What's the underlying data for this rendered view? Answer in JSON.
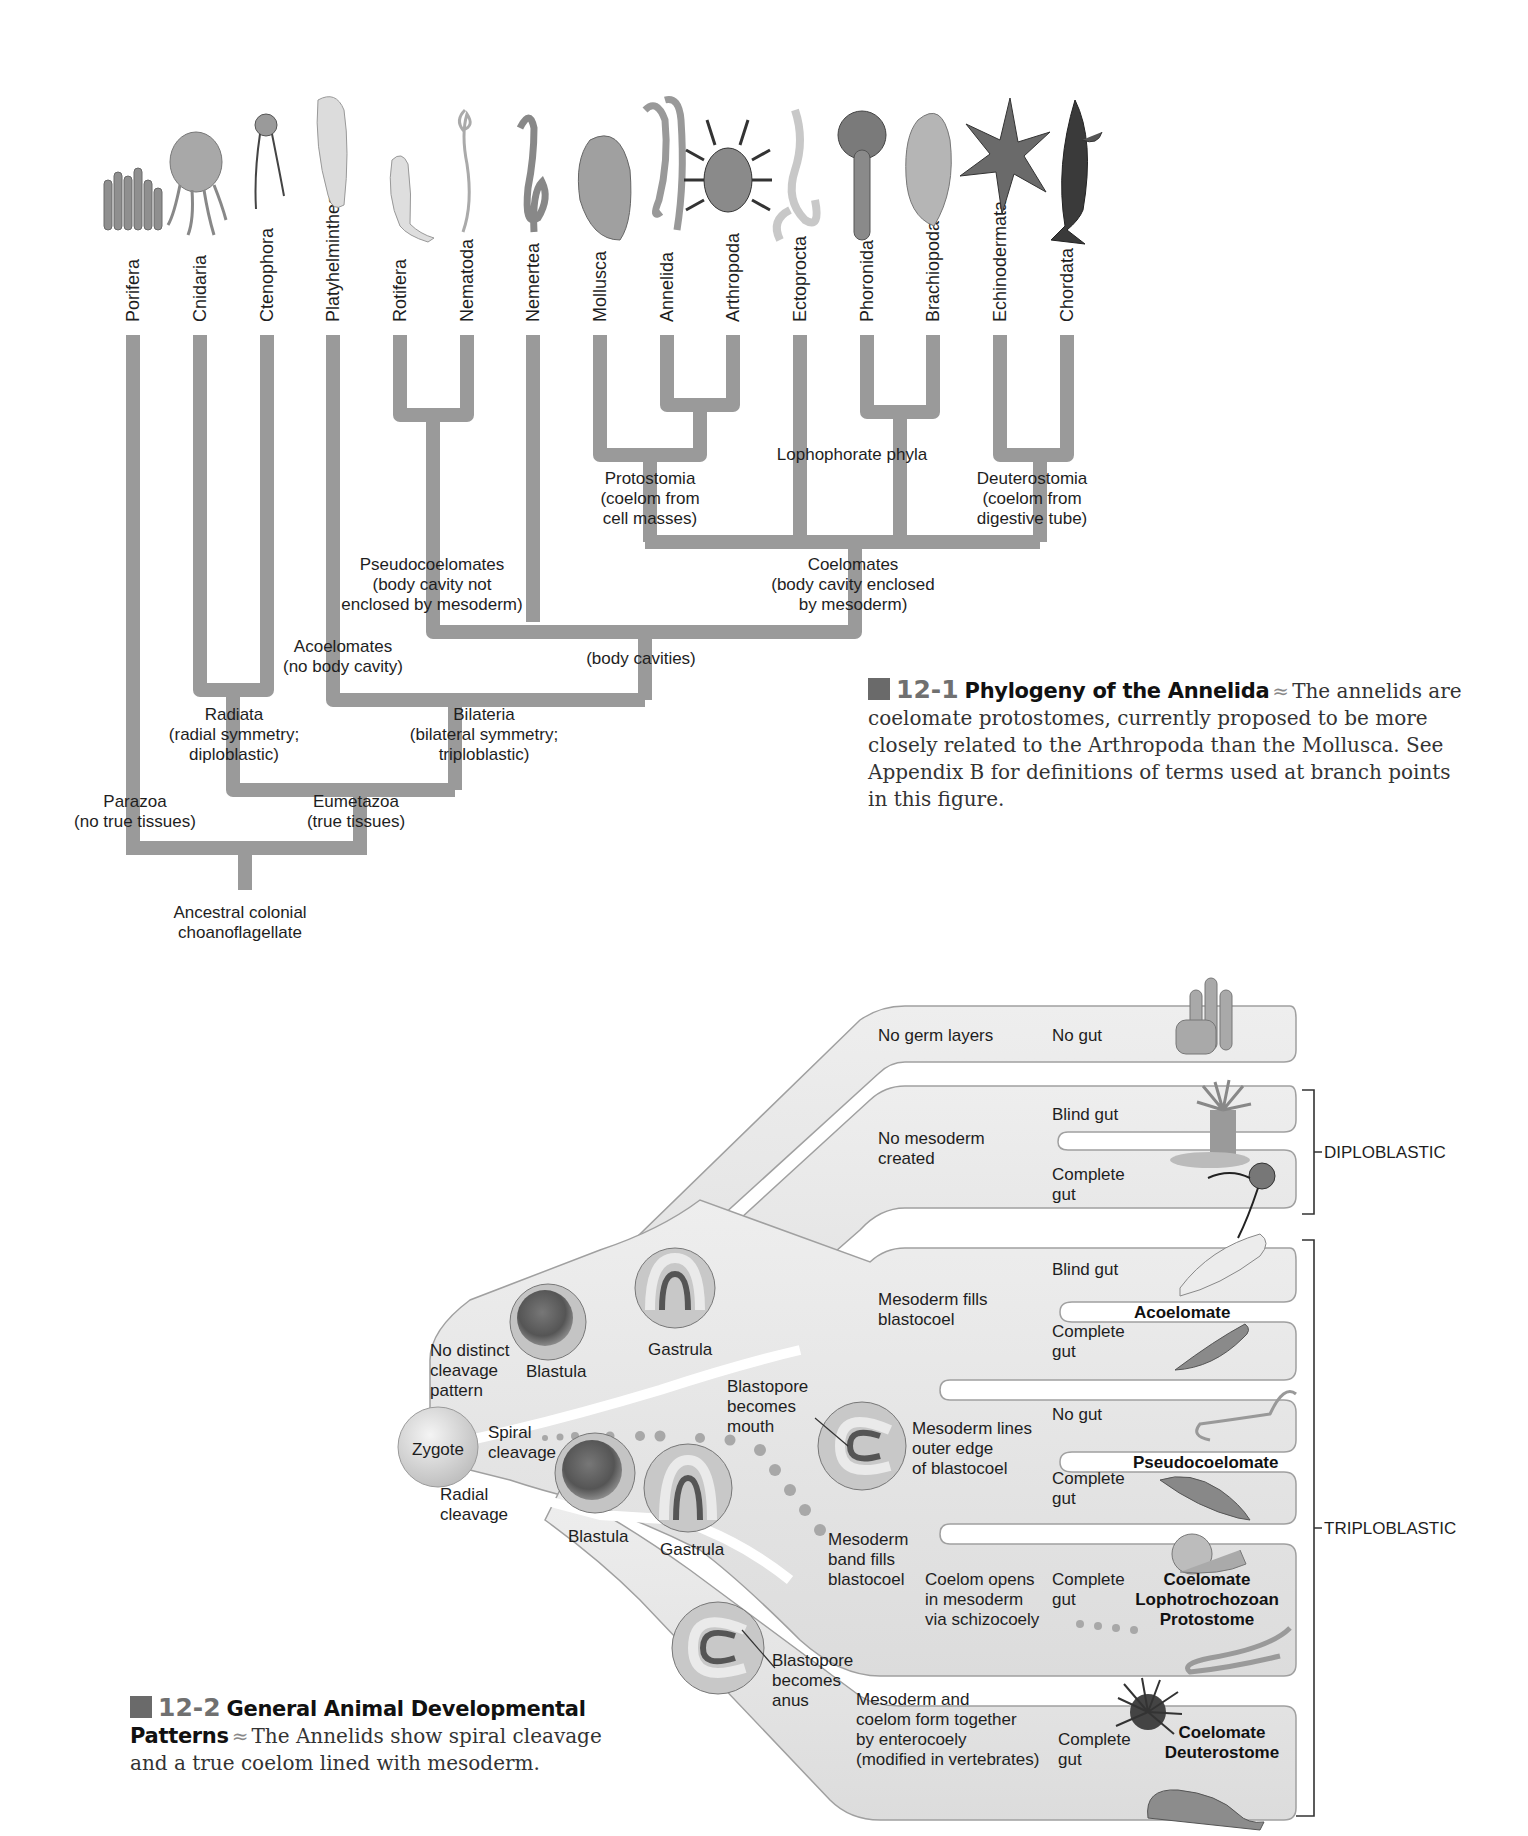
{
  "figure_12_1": {
    "phyla": [
      {
        "name": "Porifera",
        "animal": "sponge-icon"
      },
      {
        "name": "Cnidaria",
        "animal": "jellyfish-icon"
      },
      {
        "name": "Ctenophora",
        "animal": "comb-jelly-icon"
      },
      {
        "name": "Platyhelminthes",
        "animal": "flatworm-icon"
      },
      {
        "name": "Rotifera",
        "animal": "rotifer-icon"
      },
      {
        "name": "Nematoda",
        "animal": "roundworm-icon"
      },
      {
        "name": "Nemertea",
        "animal": "ribbon-worm-icon"
      },
      {
        "name": "Mollusca",
        "animal": "clam-icon"
      },
      {
        "name": "Annelida",
        "animal": "segmented-worm-icon"
      },
      {
        "name": "Arthropoda",
        "animal": "crab-icon"
      },
      {
        "name": "Ectoprocta",
        "animal": "bryozoan-icon"
      },
      {
        "name": "Phoronida",
        "animal": "phoronid-icon"
      },
      {
        "name": "Brachiopoda",
        "animal": "lamp-shell-icon"
      },
      {
        "name": "Echinodermata",
        "animal": "sea-star-icon"
      },
      {
        "name": "Chordata",
        "animal": "shark-icon"
      }
    ],
    "nodes": {
      "protostomia": [
        "Protostomia",
        "(coelom from",
        "cell masses)"
      ],
      "lophophorate": [
        "Lophophorate phyla"
      ],
      "deuterostomia": [
        "Deuterostomia",
        "(coelom from",
        "digestive tube)"
      ],
      "pseudocoelomates": [
        "Pseudocoelomates",
        "(body cavity not",
        "enclosed by mesoderm)"
      ],
      "coelomates": [
        "Coelomates",
        "(body cavity enclosed",
        "by mesoderm)"
      ],
      "body_cavities": [
        "(body cavities)"
      ],
      "acoelomates": [
        "Acoelomates",
        "(no body cavity)"
      ],
      "radiata": [
        "Radiata",
        "(radial symmetry;",
        "diploblastic)"
      ],
      "bilateria": [
        "Bilateria",
        "(bilateral symmetry;",
        "triploblastic)"
      ],
      "parazoa": [
        "Parazoa",
        "(no true tissues)"
      ],
      "eumetazoa": [
        "Eumetazoa",
        "(true tissues)"
      ],
      "ancestor": [
        "Ancestral colonial",
        "choanoflagellate"
      ]
    },
    "caption": {
      "number": "12-1",
      "title": "Phylogeny of the Annelida",
      "text": "The annelids are coelomate protostomes, currently proposed to be more closely related to the Arthropoda than the Mollusca. See Appendix B for definitions of terms used at branch points in this figure."
    }
  },
  "figure_12_2": {
    "zygote": "Zygote",
    "left_labels": {
      "no_distinct": [
        "No distinct",
        "cleavage",
        "pattern"
      ],
      "spiral": [
        "Spiral",
        "cleavage"
      ],
      "radial": [
        "Radial",
        "cleavage"
      ]
    },
    "stages": {
      "blastula_top": "Blastula",
      "gastrula_top": "Gastrula",
      "blastula_bottom": "Blastula",
      "gastrula_bottom": "Gastrula",
      "blastopore_mouth": [
        "Blastopore",
        "becomes",
        "mouth"
      ],
      "blastopore_anus": [
        "Blastopore",
        "becomes",
        "anus"
      ]
    },
    "branches": {
      "no_germ_layers": {
        "label": "No germ layers",
        "gut": "No gut"
      },
      "no_mesoderm": {
        "label": [
          "No mesoderm",
          "created"
        ],
        "gut_a": "Blind gut",
        "gut_b": [
          "Complete",
          "gut"
        ]
      },
      "mesoderm_fills": {
        "label": [
          "Mesoderm fills",
          "blastocoel"
        ],
        "gut_a": "Blind gut",
        "gut_b": [
          "Complete",
          "gut"
        ],
        "type": "Acoelomate"
      },
      "mesoderm_lines": {
        "label": [
          "Mesoderm lines",
          "outer edge",
          "of blastocoel"
        ],
        "gut_a": "No gut",
        "gut_b": [
          "Complete",
          "gut"
        ],
        "type": "Pseudocoelomate"
      },
      "mesoderm_band": {
        "label": [
          "Mesoderm",
          "band fills",
          "blastocoel"
        ],
        "coelom": [
          "Coelom opens",
          "in mesoderm",
          "via schizocoely"
        ],
        "gut": [
          "Complete",
          "gut"
        ],
        "type": [
          "Coelomate",
          "Lophotrochozoan",
          "Protostome"
        ]
      },
      "mesoderm_coelom": {
        "label": [
          "Mesoderm and",
          "coelom form together",
          "by enterocoely",
          "(modified in vertebrates)"
        ],
        "gut": [
          "Complete",
          "gut"
        ],
        "type": [
          "Coelomate",
          "Deuterostome"
        ]
      }
    },
    "brackets": {
      "diploblastic": "DIPLOBLASTIC",
      "triploblastic": "TRIPLOBLASTIC"
    },
    "caption": {
      "number": "12-2",
      "title": "General Animal Developmental Patterns",
      "title_line1": "General Animal Developmental",
      "title_line2": "Patterns",
      "text_line1": "The Annelids show spiral cleavage",
      "text_line2": "and a true coelom lined with mesoderm.",
      "text": "The Annelids show spiral cleavage and a true coelom lined with mesoderm."
    }
  },
  "colors": {
    "tree_branch": "#9a9a9a",
    "tube_fill": "#e6e6e6",
    "tube_stroke": "#9c9c9c",
    "caption_square": "#6a6a6a",
    "caption_number": "#707070"
  }
}
